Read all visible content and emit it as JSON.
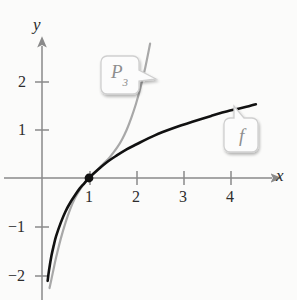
{
  "figure": {
    "background_color": "#fbfbfa"
  },
  "axes": {
    "x_label": "x",
    "y_label": "y",
    "x_ticks": [
      {
        "value": 1,
        "label": "1"
      },
      {
        "value": 2,
        "label": "2"
      },
      {
        "value": 3,
        "label": "3"
      },
      {
        "value": 4,
        "label": "4"
      }
    ],
    "y_ticks": [
      {
        "value": 2,
        "label": "2"
      },
      {
        "value": 1,
        "label": "1"
      },
      {
        "value": -1,
        "label": "−1"
      },
      {
        "value": -2,
        "label": "−2"
      }
    ],
    "axis_color": "#8a8a8a",
    "origin": {
      "x": 0,
      "y": 0
    }
  },
  "callouts": [
    {
      "name": "P3",
      "label": "P",
      "sublabel": "3",
      "color": "#9b9b9b"
    },
    {
      "name": "f",
      "label": "f",
      "sublabel": "",
      "color": "#9b9b9b"
    }
  ],
  "marked_point": {
    "x": 1,
    "y": 0,
    "color": "#111111"
  },
  "chart_data": {
    "type": "line",
    "title": "",
    "xlabel": "x",
    "ylabel": "y",
    "xlim": [
      -0.1,
      4.9
    ],
    "ylim": [
      -2.55,
      2.75
    ],
    "grid": false,
    "legend": "callout-labels",
    "x_ticks": [
      1,
      2,
      3,
      4
    ],
    "y_ticks": [
      -2,
      -1,
      1,
      2
    ],
    "series": [
      {
        "name": "f",
        "expression": "ln(x)",
        "color": "#111111",
        "width": 2.6,
        "points": [
          [
            0.12,
            -2.12
          ],
          [
            0.15,
            -1.9
          ],
          [
            0.2,
            -1.61
          ],
          [
            0.25,
            -1.39
          ],
          [
            0.3,
            -1.2
          ],
          [
            0.4,
            -0.92
          ],
          [
            0.5,
            -0.69
          ],
          [
            0.6,
            -0.51
          ],
          [
            0.7,
            -0.36
          ],
          [
            0.8,
            -0.22
          ],
          [
            0.9,
            -0.11
          ],
          [
            1.0,
            0.0
          ],
          [
            1.2,
            0.18
          ],
          [
            1.4,
            0.34
          ],
          [
            1.6,
            0.47
          ],
          [
            1.8,
            0.59
          ],
          [
            2.0,
            0.69
          ],
          [
            2.4,
            0.88
          ],
          [
            2.8,
            1.03
          ],
          [
            3.2,
            1.16
          ],
          [
            3.6,
            1.28
          ],
          [
            4.0,
            1.39
          ],
          [
            4.4,
            1.48
          ],
          [
            4.55,
            1.52
          ]
        ]
      },
      {
        "name": "P3",
        "expression": "(x-1) - (x-1)^2/2 + (x-1)^3/3",
        "color": "#a8a8a8",
        "width": 2.2,
        "points": [
          [
            0.16,
            -2.27
          ],
          [
            0.2,
            -2.09
          ],
          [
            0.25,
            -1.86
          ],
          [
            0.3,
            -1.64
          ],
          [
            0.4,
            -1.25
          ],
          [
            0.5,
            -0.92
          ],
          [
            0.6,
            -0.64
          ],
          [
            0.7,
            -0.42
          ],
          [
            0.8,
            -0.25
          ],
          [
            0.9,
            -0.11
          ],
          [
            1.0,
            0.0
          ],
          [
            1.1,
            0.1
          ],
          [
            1.2,
            0.19
          ],
          [
            1.3,
            0.29
          ],
          [
            1.4,
            0.38
          ],
          [
            1.5,
            0.5
          ],
          [
            1.6,
            0.63
          ],
          [
            1.7,
            0.79
          ],
          [
            1.8,
            0.99
          ],
          [
            1.9,
            1.24
          ],
          [
            2.0,
            1.53
          ],
          [
            2.1,
            1.88
          ],
          [
            2.2,
            2.29
          ],
          [
            2.3,
            2.77
          ]
        ]
      }
    ]
  }
}
